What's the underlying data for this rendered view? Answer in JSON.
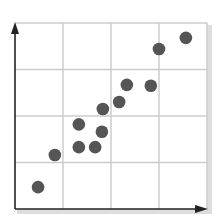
{
  "chart_data": {
    "type": "scatter",
    "title": "",
    "xlabel": "",
    "ylabel": "",
    "xlim": [
      0,
      4
    ],
    "ylim": [
      0,
      4
    ],
    "grid": true,
    "grid_divisions": 4,
    "legend": null,
    "axes_arrows": true,
    "series": [
      {
        "name": "points",
        "color": "#555555",
        "points": [
          {
            "x": 0.48,
            "y": 0.47
          },
          {
            "x": 0.83,
            "y": 1.16
          },
          {
            "x": 1.33,
            "y": 1.82
          },
          {
            "x": 1.33,
            "y": 1.33
          },
          {
            "x": 1.67,
            "y": 1.33
          },
          {
            "x": 1.81,
            "y": 1.66
          },
          {
            "x": 1.83,
            "y": 2.15
          },
          {
            "x": 2.17,
            "y": 2.3
          },
          {
            "x": 2.33,
            "y": 2.67
          },
          {
            "x": 2.83,
            "y": 2.65
          },
          {
            "x": 3.0,
            "y": 3.44
          },
          {
            "x": 3.56,
            "y": 3.68
          }
        ]
      }
    ]
  },
  "colors": {
    "grid": "#cccccc",
    "axis": "#222222",
    "point": "#555555",
    "shadow": "#dddddd"
  }
}
